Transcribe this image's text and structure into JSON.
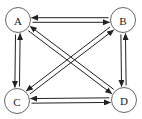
{
  "diagram": {
    "type": "directed-graph",
    "nodes": [
      {
        "id": "A",
        "label": "A",
        "x": 18,
        "y": 20
      },
      {
        "id": "B",
        "label": "B",
        "x": 123,
        "y": 20
      },
      {
        "id": "C",
        "label": "C",
        "x": 17,
        "y": 101
      },
      {
        "id": "D",
        "label": "D",
        "x": 124,
        "y": 100
      }
    ],
    "edges": [
      {
        "from": "A",
        "to": "B"
      },
      {
        "from": "B",
        "to": "A"
      },
      {
        "from": "A",
        "to": "C"
      },
      {
        "from": "C",
        "to": "A"
      },
      {
        "from": "B",
        "to": "D"
      },
      {
        "from": "D",
        "to": "B"
      },
      {
        "from": "C",
        "to": "D"
      },
      {
        "from": "D",
        "to": "C"
      },
      {
        "from": "A",
        "to": "D"
      },
      {
        "from": "D",
        "to": "A"
      },
      {
        "from": "B",
        "to": "C"
      },
      {
        "from": "C",
        "to": "B"
      }
    ],
    "colors": {
      "stroke": "#222222",
      "node_border": "#555555",
      "background": "#ffffff"
    }
  }
}
